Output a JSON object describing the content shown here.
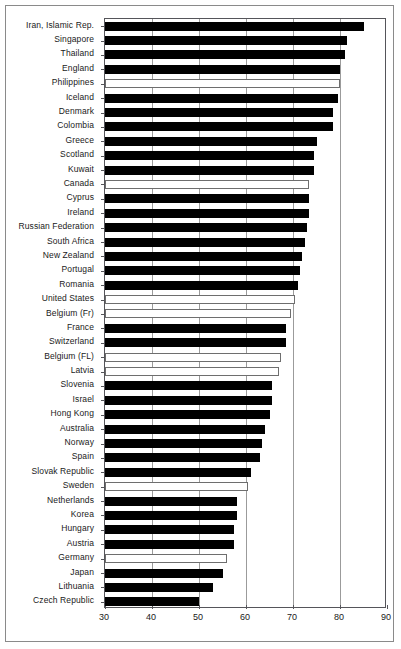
{
  "chart_data": {
    "type": "bar",
    "orientation": "horizontal",
    "title": "",
    "subtitle": "",
    "xlabel": "",
    "ylabel": "",
    "xlim": [
      30,
      90
    ],
    "xticks": [
      30,
      40,
      50,
      60,
      70,
      80,
      90
    ],
    "xtick_labels": [
      "30",
      "40",
      "50",
      "60",
      "70",
      "80",
      "90"
    ],
    "grid": true,
    "grid_axis": "x",
    "legend": "none",
    "series_styles": {
      "filled_color": "#000000",
      "hollow_fill": "#ffffff",
      "hollow_border": "#6e6e6e"
    },
    "categories": [
      "Iran, Islamic Rep.",
      "Singapore",
      "Thailand",
      "England",
      "Philippines",
      "Iceland",
      "Denmark",
      "Colombia",
      "Greece",
      "Scotland",
      "Kuwait",
      "Canada",
      "Cyprus",
      "Ireland",
      "Russian Federation",
      "South Africa",
      "New Zealand",
      "Portugal",
      "Romania",
      "United States",
      "Belgium (Fr)",
      "France",
      "Switzerland",
      "Belgium (FL)",
      "Latvia",
      "Slovenia",
      "Israel",
      "Hong Kong",
      "Australia",
      "Norway",
      "Spain",
      "Slovak Republic",
      "Sweden",
      "Netherlands",
      "Korea",
      "Hungary",
      "Austria",
      "Germany",
      "Japan",
      "Lithuania",
      "Czech Republic"
    ],
    "values": [
      85.0,
      81.5,
      81.0,
      80.0,
      80.0,
      79.5,
      78.5,
      78.5,
      75.0,
      74.5,
      74.5,
      73.5,
      73.5,
      73.5,
      73.0,
      72.5,
      72.0,
      71.5,
      71.0,
      70.5,
      69.5,
      68.5,
      68.5,
      67.5,
      67.0,
      65.5,
      65.5,
      65.0,
      64.0,
      63.5,
      63.0,
      61.0,
      60.5,
      58.0,
      58.0,
      57.5,
      57.5,
      56.0,
      55.0,
      53.0,
      50.0
    ],
    "styles": [
      "filled",
      "filled",
      "filled",
      "filled",
      "hollow",
      "filled",
      "filled",
      "filled",
      "filled",
      "filled",
      "filled",
      "hollow",
      "filled",
      "filled",
      "filled",
      "filled",
      "filled",
      "filled",
      "filled",
      "hollow",
      "hollow",
      "filled",
      "filled",
      "hollow",
      "hollow",
      "filled",
      "filled",
      "filled",
      "filled",
      "filled",
      "filled",
      "filled",
      "hollow",
      "filled",
      "filled",
      "filled",
      "filled",
      "hollow",
      "filled",
      "filled",
      "filled"
    ]
  }
}
